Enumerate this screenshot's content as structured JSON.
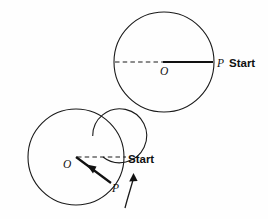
{
  "figure": {
    "background_color": "#fefefe",
    "ink_color": "#111111",
    "top_diagram": {
      "name": "disk-with-radius-at-start",
      "circle": {
        "cx": 164,
        "cy": 62,
        "r": 50
      },
      "center_label": "O",
      "center_label_pos": {
        "x": 160,
        "y": 74
      },
      "dashed_radius": {
        "from_x": 114,
        "from_y": 62,
        "to_x": 164,
        "to_y": 62
      },
      "solid_radius": {
        "from_x": 164,
        "from_y": 62,
        "to_x": 214,
        "to_y": 62
      },
      "point_label": "P",
      "point_label_pos": {
        "x": 217,
        "y": 66
      },
      "start_label": "Start",
      "start_label_pos": {
        "x": 230,
        "y": 66
      }
    },
    "bottom_diagram": {
      "name": "spiral-disk-with-rotated-radius",
      "outer_circle": {
        "cx": 76,
        "cy": 157,
        "r": 48
      },
      "inner_spiral": {
        "cx": 76,
        "cy": 157,
        "r": 27
      },
      "center_label": "O",
      "center_label_pos": {
        "x": 64,
        "y": 167
      },
      "dashed_start_line": {
        "from_x": 76,
        "from_y": 157,
        "to_x": 126,
        "to_y": 157
      },
      "solid_radius": {
        "from_x": 76,
        "from_y": 157,
        "to_x": 112,
        "to_y": 184
      },
      "inward_arrow_tip": {
        "x": 89,
        "y": 167
      },
      "point_label": "P",
      "point_label_pos": {
        "x": 113,
        "y": 191
      },
      "start_label": "Start",
      "start_label_pos": {
        "x": 129,
        "y": 162
      },
      "rotation_arrow": {
        "name": "counterclockwise-rotation-arrow",
        "tail_x": 126,
        "tail_y": 207,
        "tip_x": 134,
        "tip_y": 174
      }
    }
  }
}
